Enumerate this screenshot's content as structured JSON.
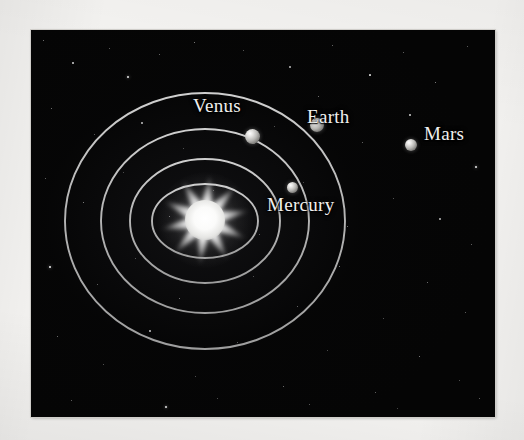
{
  "figure": {
    "background_color": "#f2f1ef",
    "sky_color": "#050505",
    "orbit_color": "#b9b9b9",
    "label_color": "#f0efee"
  },
  "diagram": {
    "center_label": "Sun",
    "orbit_center": {
      "x": 205,
      "y": 221
    },
    "orbits": [
      {
        "name": "Mercury orbit",
        "rx": 53,
        "ry": 37
      },
      {
        "name": "Venus orbit",
        "rx": 75,
        "ry": 62
      },
      {
        "name": "Earth orbit",
        "rx": 104,
        "ry": 92
      },
      {
        "name": "Mars orbit",
        "rx": 140,
        "ry": 128
      }
    ],
    "planets": [
      {
        "name": "Mercury",
        "label": "Mercury",
        "orbit_index": 0,
        "dot": {
          "x": 292,
          "y": 187,
          "d": 11
        },
        "label_pos": {
          "x": 267,
          "y": 194
        }
      },
      {
        "name": "Venus",
        "label": "Venus",
        "orbit_index": 1,
        "dot": {
          "x": 252,
          "y": 136,
          "d": 15
        },
        "label_pos": {
          "x": 193,
          "y": 95
        }
      },
      {
        "name": "Earth",
        "label": "Earth",
        "orbit_index": 2,
        "dot": {
          "x": 317,
          "y": 125,
          "d": 14
        },
        "label_pos": {
          "x": 307,
          "y": 106
        }
      },
      {
        "name": "Mars",
        "label": "Mars",
        "orbit_index": 3,
        "dot": {
          "x": 411,
          "y": 145,
          "d": 12
        },
        "label_pos": {
          "x": 424,
          "y": 123
        }
      }
    ],
    "sun": {
      "label": "Sun",
      "center": {
        "x": 205,
        "y": 220
      },
      "points": 10,
      "outer_radius": 46,
      "inner_radius": 17,
      "color": "#ffffff"
    }
  },
  "chart_data": {
    "type": "scatter",
    "xlabel": "",
    "ylabel": "",
    "legend_position": "none",
    "grid": false,
    "categories": [
      "Mercury",
      "Venus",
      "Earth",
      "Mars"
    ],
    "series": [
      {
        "name": "Orbit semi-major radius (px)",
        "values": [
          53,
          75,
          104,
          140
        ]
      },
      {
        "name": "Orbit semi-minor radius (px)",
        "values": [
          37,
          62,
          92,
          128
        ]
      },
      {
        "name": "Planet marker diameter (px)",
        "values": [
          11,
          15,
          14,
          12
        ]
      }
    ],
    "annotations": [
      "Mercury",
      "Venus",
      "Earth",
      "Mars"
    ]
  },
  "stars": [
    {
      "x": 12,
      "y": 10,
      "s": 1.2,
      "o": 0.55
    },
    {
      "x": 41,
      "y": 32,
      "s": 1.6,
      "o": 0.75
    },
    {
      "x": 78,
      "y": 18,
      "s": 1.1,
      "o": 0.45
    },
    {
      "x": 96,
      "y": 46,
      "s": 2.0,
      "o": 0.9
    },
    {
      "x": 128,
      "y": 24,
      "s": 1.2,
      "o": 0.5
    },
    {
      "x": 163,
      "y": 12,
      "s": 1.4,
      "o": 0.6
    },
    {
      "x": 212,
      "y": 20,
      "s": 1.1,
      "o": 0.42
    },
    {
      "x": 258,
      "y": 36,
      "s": 1.5,
      "o": 0.66
    },
    {
      "x": 301,
      "y": 15,
      "s": 1.2,
      "o": 0.5
    },
    {
      "x": 338,
      "y": 44,
      "s": 1.7,
      "o": 0.8
    },
    {
      "x": 372,
      "y": 22,
      "s": 1.2,
      "o": 0.48
    },
    {
      "x": 404,
      "y": 52,
      "s": 1.4,
      "o": 0.62
    },
    {
      "x": 436,
      "y": 16,
      "s": 1.1,
      "o": 0.44
    },
    {
      "x": 20,
      "y": 78,
      "s": 1.3,
      "o": 0.55
    },
    {
      "x": 63,
      "y": 104,
      "s": 1.1,
      "o": 0.42
    },
    {
      "x": 110,
      "y": 92,
      "s": 1.5,
      "o": 0.68
    },
    {
      "x": 152,
      "y": 118,
      "s": 1.0,
      "o": 0.38
    },
    {
      "x": 196,
      "y": 74,
      "s": 1.2,
      "o": 0.5
    },
    {
      "x": 243,
      "y": 96,
      "s": 1.1,
      "o": 0.4
    },
    {
      "x": 287,
      "y": 66,
      "s": 1.3,
      "o": 0.55
    },
    {
      "x": 331,
      "y": 112,
      "s": 1.2,
      "o": 0.48
    },
    {
      "x": 378,
      "y": 84,
      "s": 1.6,
      "o": 0.74
    },
    {
      "x": 418,
      "y": 106,
      "s": 1.2,
      "o": 0.5
    },
    {
      "x": 444,
      "y": 136,
      "s": 2.1,
      "o": 0.92
    },
    {
      "x": 14,
      "y": 148,
      "s": 1.2,
      "o": 0.48
    },
    {
      "x": 52,
      "y": 172,
      "s": 1.4,
      "o": 0.62
    },
    {
      "x": 92,
      "y": 142,
      "s": 1.0,
      "o": 0.36
    },
    {
      "x": 138,
      "y": 186,
      "s": 1.3,
      "o": 0.56
    },
    {
      "x": 182,
      "y": 160,
      "s": 1.1,
      "o": 0.42
    },
    {
      "x": 228,
      "y": 204,
      "s": 1.2,
      "o": 0.46
    },
    {
      "x": 272,
      "y": 152,
      "s": 1.0,
      "o": 0.36
    },
    {
      "x": 316,
      "y": 196,
      "s": 1.3,
      "o": 0.55
    },
    {
      "x": 362,
      "y": 168,
      "s": 1.1,
      "o": 0.42
    },
    {
      "x": 408,
      "y": 188,
      "s": 1.5,
      "o": 0.66
    },
    {
      "x": 440,
      "y": 214,
      "s": 1.2,
      "o": 0.48
    },
    {
      "x": 18,
      "y": 236,
      "s": 2.2,
      "o": 0.95
    },
    {
      "x": 66,
      "y": 254,
      "s": 1.2,
      "o": 0.46
    },
    {
      "x": 104,
      "y": 228,
      "s": 1.1,
      "o": 0.4
    },
    {
      "x": 148,
      "y": 268,
      "s": 1.3,
      "o": 0.55
    },
    {
      "x": 222,
      "y": 246,
      "s": 1.1,
      "o": 0.4
    },
    {
      "x": 266,
      "y": 276,
      "s": 1.2,
      "o": 0.48
    },
    {
      "x": 308,
      "y": 236,
      "s": 1.4,
      "o": 0.62
    },
    {
      "x": 352,
      "y": 288,
      "s": 1.1,
      "o": 0.4
    },
    {
      "x": 396,
      "y": 252,
      "s": 1.3,
      "o": 0.54
    },
    {
      "x": 434,
      "y": 282,
      "s": 1.2,
      "o": 0.46
    },
    {
      "x": 26,
      "y": 306,
      "s": 1.3,
      "o": 0.52
    },
    {
      "x": 72,
      "y": 334,
      "s": 1.1,
      "o": 0.4
    },
    {
      "x": 118,
      "y": 300,
      "s": 1.5,
      "o": 0.68
    },
    {
      "x": 164,
      "y": 346,
      "s": 1.1,
      "o": 0.38
    },
    {
      "x": 206,
      "y": 312,
      "s": 1.2,
      "o": 0.46
    },
    {
      "x": 252,
      "y": 356,
      "s": 1.3,
      "o": 0.54
    },
    {
      "x": 296,
      "y": 320,
      "s": 1.0,
      "o": 0.36
    },
    {
      "x": 344,
      "y": 362,
      "s": 1.2,
      "o": 0.48
    },
    {
      "x": 388,
      "y": 326,
      "s": 1.4,
      "o": 0.6
    },
    {
      "x": 428,
      "y": 350,
      "s": 1.1,
      "o": 0.4
    },
    {
      "x": 40,
      "y": 370,
      "s": 1.2,
      "o": 0.46
    },
    {
      "x": 134,
      "y": 376,
      "s": 1.9,
      "o": 0.88
    },
    {
      "x": 186,
      "y": 368,
      "s": 1.1,
      "o": 0.38
    },
    {
      "x": 278,
      "y": 374,
      "s": 1.2,
      "o": 0.44
    },
    {
      "x": 366,
      "y": 378,
      "s": 1.0,
      "o": 0.34
    },
    {
      "x": 448,
      "y": 368,
      "s": 1.2,
      "o": 0.46
    }
  ]
}
